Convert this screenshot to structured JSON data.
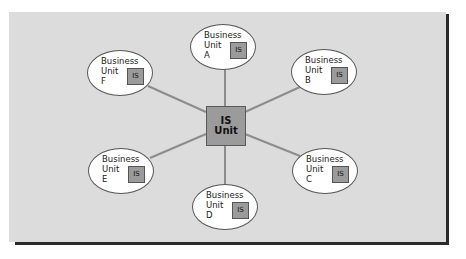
{
  "diagram": {
    "type": "hub-and-spoke",
    "center": {
      "line1": "IS",
      "line2": "Unit"
    },
    "nodes": [
      {
        "id": "A",
        "line1": "Business",
        "line2": "Unit",
        "line3": "A",
        "badge": "IS"
      },
      {
        "id": "B",
        "line1": "Business",
        "line2": "Unit",
        "line3": "B",
        "badge": "IS"
      },
      {
        "id": "C",
        "line1": "Business",
        "line2": "Unit",
        "line3": "C",
        "badge": "IS"
      },
      {
        "id": "D",
        "line1": "Business",
        "line2": "Unit",
        "line3": "D",
        "badge": "IS"
      },
      {
        "id": "E",
        "line1": "Business",
        "line2": "Unit",
        "line3": "E",
        "badge": "IS"
      },
      {
        "id": "F",
        "line1": "Business",
        "line2": "Unit",
        "line3": "F",
        "badge": "IS"
      }
    ],
    "colors": {
      "panel": "#dcdcdc",
      "shadow": "#2a2a2a",
      "box_fill": "#9b9b9b",
      "connector": "#8c8c8c",
      "node_fill": "#ffffff"
    }
  }
}
